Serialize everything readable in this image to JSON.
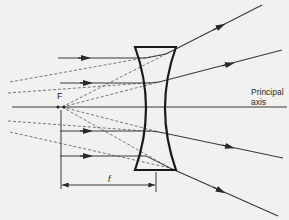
{
  "diagram": {
    "type": "concave-lens-ray-diagram",
    "labels": {
      "focal_point": "F",
      "principal_axis_line1": "Principal",
      "principal_axis_line2": "axis",
      "focal_length": "f"
    },
    "colors": {
      "background": "#f1f1ef",
      "ray": "#3a3a3a",
      "lens": "#1a1a1a",
      "construction": "#6a6a6a"
    },
    "principal_axis": {
      "x1": 12,
      "y": 107,
      "x2": 287
    },
    "focal_point": {
      "x": 62,
      "y": 107
    },
    "lens": {
      "left": 135,
      "right": 176,
      "top": 47,
      "bottom": 170,
      "waist_left": 151,
      "waist_right": 160
    },
    "incident_rays": [
      {
        "y": 58,
        "hit_x": 146,
        "exit_x": 166,
        "exit_y": 54,
        "end_x": 262,
        "end_y": 5
      },
      {
        "y": 83,
        "hit_x": 151,
        "exit_x": 159,
        "exit_y": 82,
        "end_x": 282,
        "end_y": 50
      },
      {
        "y": 131,
        "hit_x": 151,
        "exit_x": 159,
        "exit_y": 132,
        "end_x": 283,
        "end_y": 158
      },
      {
        "y": 156,
        "hit_x": 146,
        "exit_x": 170,
        "exit_y": 168,
        "end_x": 278,
        "end_y": 216
      }
    ],
    "focal_length_marker": {
      "x1": 62,
      "x2": 155,
      "y": 185
    }
  }
}
